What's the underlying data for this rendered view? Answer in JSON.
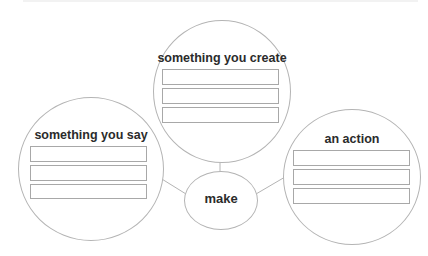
{
  "diagram": {
    "type": "word-web",
    "center": {
      "label": "make"
    },
    "branches": [
      {
        "label": "something you create",
        "blank_lines": 3
      },
      {
        "label": "something you say",
        "blank_lines": 3
      },
      {
        "label": "an action",
        "blank_lines": 3
      }
    ]
  },
  "colors": {
    "stroke": "#b4b4b4",
    "box_stroke": "#a8a8a8",
    "text": "#2b2b2b",
    "background": "#ffffff"
  }
}
